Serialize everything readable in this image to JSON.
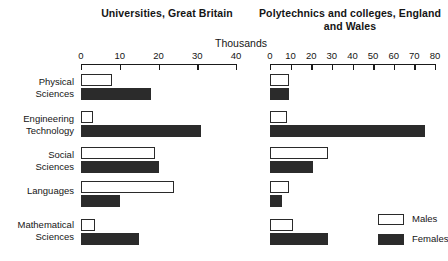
{
  "chart_data": {
    "type": "bar",
    "units_label": "Thousands",
    "orientation": "horizontal",
    "grid": false,
    "legend_position": "bottom-right",
    "legend": [
      {
        "name": "Males",
        "fill": "#ffffff",
        "stroke": "#2a2a2a"
      },
      {
        "name": "Females",
        "fill": "#2b2b2b",
        "stroke": "#2b2b2b"
      }
    ],
    "categories": [
      "Physical\nSciences",
      "Engineering\nTechnology",
      "Social\nSciences",
      "Languages",
      "Mathematical\nSciences"
    ],
    "panels": [
      {
        "id": "universities",
        "title": "Universities, Great Britain",
        "xlabel": "Thousands",
        "xlim": [
          0,
          40
        ],
        "xticks": [
          0,
          10,
          20,
          30,
          40
        ],
        "series": [
          {
            "name": "Males",
            "values": [
              8,
              3,
              19,
              24,
              3.5
            ]
          },
          {
            "name": "Females",
            "values": [
              18,
              31,
              20,
              10,
              15
            ]
          }
        ]
      },
      {
        "id": "polytechnics",
        "title": "Polytechnics and colleges,\nEngland and Wales",
        "xlabel": "Thousands",
        "xlim": [
          0,
          80
        ],
        "xticks": [
          0,
          10,
          20,
          30,
          40,
          50,
          60,
          70,
          80
        ],
        "series": [
          {
            "name": "Males",
            "values": [
              9,
              8,
              28,
              9,
              11
            ]
          },
          {
            "name": "Females",
            "values": [
              9,
              75,
              21,
              6,
              28
            ]
          }
        ]
      }
    ]
  }
}
